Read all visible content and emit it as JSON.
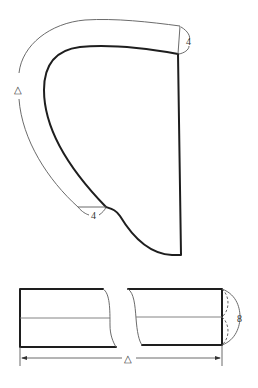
{
  "figure": {
    "type": "pattern-diagram",
    "upper_piece": {
      "description": "curved facing strip around shaped pattern piece",
      "labels": {
        "top_width": "4",
        "bottom_width": "4",
        "length": "△"
      }
    },
    "lower_piece": {
      "description": "straight strip with break, folded lengthwise",
      "labels": {
        "width": "8",
        "length": "△"
      }
    },
    "colors": {
      "outline": "#1e1e1e",
      "guide": "#5a5a5a",
      "background": "#ffffff"
    }
  }
}
